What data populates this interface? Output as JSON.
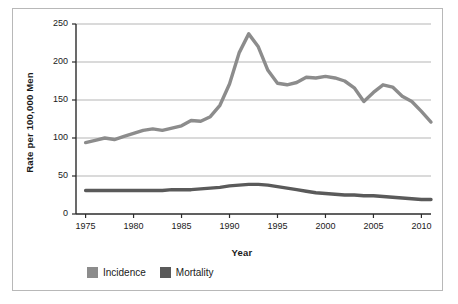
{
  "chart_data": {
    "type": "line",
    "title": "",
    "xlabel": "Year",
    "ylabel": "Rate per 100,000 Men",
    "xlim": [
      1974,
      2011
    ],
    "ylim": [
      0,
      250
    ],
    "xticks": [
      1975,
      1980,
      1985,
      1990,
      1995,
      2000,
      2005,
      2010
    ],
    "yticks": [
      0,
      50,
      100,
      150,
      200,
      250
    ],
    "xtick_labels": [
      "1975",
      "1980",
      "1985",
      "1990",
      "1995",
      "2000",
      "2005",
      "2010"
    ],
    "ytick_labels": [
      "0",
      "50",
      "100",
      "150",
      "200",
      "250"
    ],
    "grid": true,
    "grid_axis": "y",
    "legend_position": "bottom-left",
    "x": [
      1975,
      1976,
      1977,
      1978,
      1979,
      1980,
      1981,
      1982,
      1983,
      1984,
      1985,
      1986,
      1987,
      1988,
      1989,
      1990,
      1991,
      1992,
      1993,
      1994,
      1995,
      1996,
      1997,
      1998,
      1999,
      2000,
      2001,
      2002,
      2003,
      2004,
      2005,
      2006,
      2007,
      2008,
      2009,
      2010,
      2011
    ],
    "series": [
      {
        "name": "Incidence",
        "color": "#8c8c8c",
        "values": [
          94,
          97,
          100,
          98,
          102,
          106,
          110,
          112,
          110,
          113,
          116,
          123,
          122,
          128,
          143,
          171,
          212,
          237,
          220,
          189,
          172,
          170,
          173,
          180,
          179,
          181,
          179,
          175,
          166,
          148,
          160,
          170,
          167,
          155,
          148,
          135,
          121
        ]
      },
      {
        "name": "Mortality",
        "color": "#5a5a5a",
        "values": [
          31,
          31,
          31,
          31,
          31,
          31,
          31,
          31,
          31,
          32,
          32,
          32,
          33,
          34,
          35,
          37,
          38,
          39,
          39,
          38,
          36,
          34,
          32,
          30,
          28,
          27,
          26,
          25,
          25,
          24,
          24,
          23,
          22,
          21,
          20,
          19,
          19
        ]
      }
    ]
  },
  "legend": {
    "items": [
      {
        "label": "Incidence",
        "color": "#8c8c8c"
      },
      {
        "label": "Mortality",
        "color": "#5a5a5a"
      }
    ]
  },
  "axes": {
    "x_title": "Year",
    "y_title": "Rate per 100,000 Men"
  },
  "colors": {
    "incidence": "#8c8c8c",
    "mortality": "#5a5a5a",
    "gridline": "#b5b5b5",
    "axis": "#2b2b2b",
    "frame": "#b8b8b8",
    "background": "#ffffff"
  }
}
